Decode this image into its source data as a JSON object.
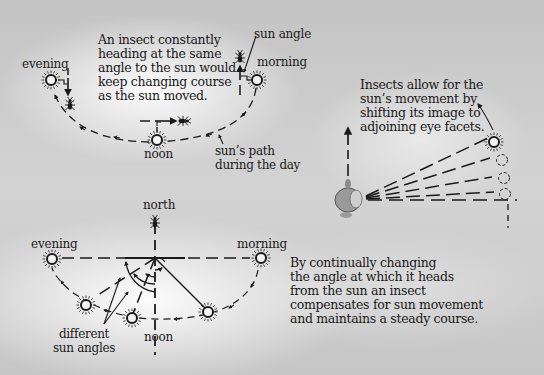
{
  "diagram": {
    "title": "",
    "panels": [
      {
        "id": "constant-angle",
        "caption": "An insect constantly\nheading at the same\nangle to the sun would\nkeep changing course\nas the sun moved.",
        "labels": {
          "evening": "evening",
          "morning": "morning",
          "noon": "noon",
          "sun_angle": "sun angle",
          "sun_path": "sun’s path\nduring the day"
        }
      },
      {
        "id": "eye-facets",
        "caption": "Insects allow for the\nsun’s movement by\nshifting its image to\nadjoining eye facets."
      },
      {
        "id": "compensating",
        "caption": "By continually changing\nthe angle at which it heads\nfrom the sun an insect\ncompensates for sun movement\nand maintains a steady course.",
        "labels": {
          "north": "north",
          "evening": "evening",
          "morning": "morning",
          "noon": "noon",
          "different_sun_angles": "different\nsun angles"
        }
      }
    ],
    "icons": [
      "sun-icon",
      "insect-icon",
      "insect-eye-icon",
      "arrow-icon"
    ],
    "colors": {
      "background": "#c9c9c9",
      "highlight": "#ffffff",
      "ink": "#1a1a1a"
    }
  }
}
